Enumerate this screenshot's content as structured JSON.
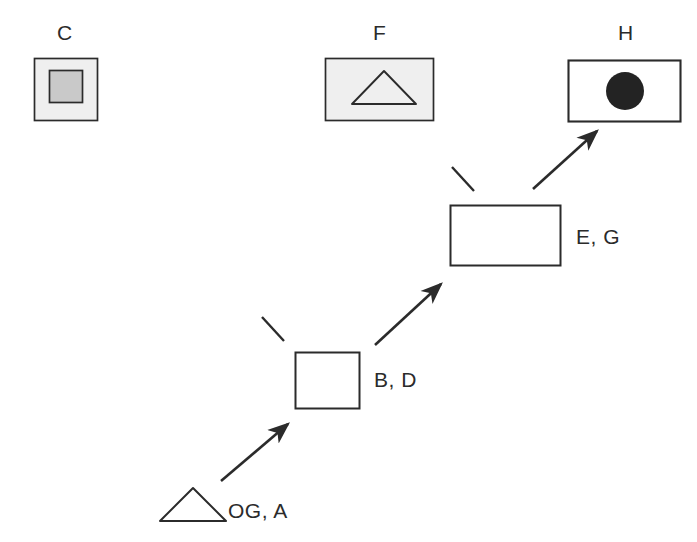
{
  "diagram": {
    "colors": {
      "stroke": "#2b2b2b",
      "fill_light_gray": "#efefef",
      "fill_mid_gray": "#c9c9c9",
      "fill_black": "#232323",
      "fill_white": "#ffffff",
      "background": "#ffffff"
    },
    "reference_row": [
      {
        "id": "C",
        "label": "C",
        "icon": "gray-square-in-gray-square-icon",
        "description": "light gray square containing a darker gray square"
      },
      {
        "id": "F",
        "label": "F",
        "icon": "triangle-in-gray-rectangle-icon",
        "description": "light gray rectangle containing an outlined triangle"
      },
      {
        "id": "H",
        "label": "H",
        "icon": "filled-circle-in-white-rectangle-icon",
        "description": "white rectangle containing a solid black circle"
      }
    ],
    "chain": [
      {
        "id": "OGA",
        "label": "OG, A",
        "icon": "outlined-triangle-icon",
        "description": "outlined triangle, start of chain"
      },
      {
        "id": "BD",
        "label": "B, D",
        "icon": "white-square-icon",
        "description": "white square with dark outline"
      },
      {
        "id": "EG",
        "label": "E, G",
        "icon": "white-rectangle-icon",
        "description": "white rectangle with dark outline"
      }
    ],
    "arrows": [
      {
        "id": "arrow-oga-to-bd",
        "from": "OGA",
        "to": "BD",
        "type": "arrow",
        "direction": "up-right"
      },
      {
        "id": "arrow-bd-to-eg",
        "from": "BD",
        "to": "EG",
        "type": "arrow",
        "direction": "up-right"
      },
      {
        "id": "arrow-eg-to-h",
        "from": "EG",
        "to": "H",
        "type": "arrow",
        "direction": "up-right"
      }
    ],
    "ticks": [
      {
        "id": "tick-bd",
        "near": "BD",
        "type": "line-segment",
        "direction": "up-left"
      },
      {
        "id": "tick-eg",
        "near": "EG",
        "type": "line-segment",
        "direction": "up-left"
      }
    ]
  }
}
